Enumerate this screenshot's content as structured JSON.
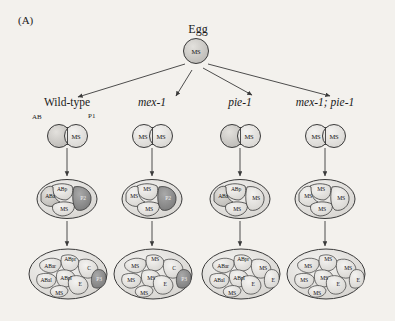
{
  "figure": {
    "panel_label": "(A)",
    "root": {
      "label": "Egg",
      "cell_text": "MS"
    },
    "background_color": "#f3f1ed",
    "cell_fill_light": "#e8e6e2",
    "cell_fill_mid": "#cfcdc9",
    "cell_fill_dark": "#8d8d8d",
    "stroke_color": "#3a3a3a"
  },
  "columns": [
    {
      "name": "wild-type",
      "header": "Wild-type",
      "italic": false
    },
    {
      "name": "mex-1",
      "header": "mex-1",
      "italic": true
    },
    {
      "name": "pie-1",
      "header": "pie-1",
      "italic": true
    },
    {
      "name": "mex-1-pie-1",
      "header": "mex-1; pie-1",
      "italic": true
    }
  ],
  "annotations": {
    "ab_label": "AB",
    "p1_label": "P1"
  },
  "stages": {
    "two_cell": [
      {
        "column": "wild-type",
        "cells": [
          {
            "id": "left",
            "label": "",
            "shade": "mid"
          },
          {
            "id": "right",
            "label": "MS",
            "shade": "light"
          }
        ]
      },
      {
        "column": "mex-1",
        "cells": [
          {
            "id": "left",
            "label": "MS",
            "shade": "light"
          },
          {
            "id": "right",
            "label": "MS",
            "shade": "light"
          }
        ]
      },
      {
        "column": "pie-1",
        "cells": [
          {
            "id": "left",
            "label": "",
            "shade": "mid"
          },
          {
            "id": "right",
            "label": "MS",
            "shade": "light"
          }
        ]
      },
      {
        "column": "mex-1-pie-1",
        "cells": [
          {
            "id": "left",
            "label": "MS",
            "shade": "light"
          },
          {
            "id": "right",
            "label": "MS",
            "shade": "light"
          }
        ]
      }
    ],
    "four_cell": [
      {
        "column": "wild-type",
        "cells": [
          {
            "id": "ABa",
            "label": "ABa",
            "shade": "light"
          },
          {
            "id": "ABp",
            "label": "ABp",
            "shade": "light"
          },
          {
            "id": "MS",
            "label": "MS",
            "shade": "light"
          },
          {
            "id": "P2",
            "label": "P2",
            "shade": "dark"
          }
        ]
      },
      {
        "column": "mex-1",
        "cells": [
          {
            "id": "ABa",
            "label": "MS",
            "shade": "light"
          },
          {
            "id": "ABp",
            "label": "MS",
            "shade": "light"
          },
          {
            "id": "MS",
            "label": "MS",
            "shade": "light"
          },
          {
            "id": "P2",
            "label": "P2",
            "shade": "dark"
          }
        ]
      },
      {
        "column": "pie-1",
        "cells": [
          {
            "id": "ABa",
            "label": "ABa",
            "shade": "light"
          },
          {
            "id": "ABp",
            "label": "ABp",
            "shade": "light"
          },
          {
            "id": "MS",
            "label": "MS",
            "shade": "light"
          },
          {
            "id": "P2",
            "label": "MS",
            "shade": "light"
          }
        ]
      },
      {
        "column": "mex-1-pie-1",
        "cells": [
          {
            "id": "ABa",
            "label": "MS",
            "shade": "light"
          },
          {
            "id": "ABp",
            "label": "MS",
            "shade": "light"
          },
          {
            "id": "MS",
            "label": "MS",
            "shade": "light"
          },
          {
            "id": "P2",
            "label": "MS",
            "shade": "light"
          }
        ]
      }
    ],
    "eight_cell": [
      {
        "column": "wild-type",
        "cells": [
          {
            "id": "ABar",
            "label": "ABar",
            "shade": "light"
          },
          {
            "id": "ABpr",
            "label": "ABpr",
            "shade": "light"
          },
          {
            "id": "ABal",
            "label": "ABal",
            "shade": "light"
          },
          {
            "id": "ABpl",
            "label": "ABpl",
            "shade": "light"
          },
          {
            "id": "MS",
            "label": "MS",
            "shade": "light"
          },
          {
            "id": "E",
            "label": "E",
            "shade": "light"
          },
          {
            "id": "C",
            "label": "C",
            "shade": "light"
          },
          {
            "id": "P3",
            "label": "P3",
            "shade": "dark"
          }
        ]
      },
      {
        "column": "mex-1",
        "cells": [
          {
            "id": "ABar",
            "label": "MS",
            "shade": "light"
          },
          {
            "id": "ABpr",
            "label": "MS",
            "shade": "light"
          },
          {
            "id": "ABal",
            "label": "MS",
            "shade": "light"
          },
          {
            "id": "ABpl",
            "label": "MS",
            "shade": "light"
          },
          {
            "id": "MS",
            "label": "MS",
            "shade": "light"
          },
          {
            "id": "E",
            "label": "E",
            "shade": "light"
          },
          {
            "id": "C",
            "label": "C",
            "shade": "light"
          },
          {
            "id": "P3",
            "label": "P3",
            "shade": "dark"
          }
        ]
      },
      {
        "column": "pie-1",
        "cells": [
          {
            "id": "ABar",
            "label": "ABar",
            "shade": "light"
          },
          {
            "id": "ABpr",
            "label": "ABpr",
            "shade": "light"
          },
          {
            "id": "ABal",
            "label": "ABal",
            "shade": "light"
          },
          {
            "id": "ABpl",
            "label": "ABpl",
            "shade": "light"
          },
          {
            "id": "MS",
            "label": "MS",
            "shade": "light"
          },
          {
            "id": "E",
            "label": "E",
            "shade": "light"
          },
          {
            "id": "C",
            "label": "MS",
            "shade": "light"
          },
          {
            "id": "P3",
            "label": "E",
            "shade": "light"
          }
        ]
      },
      {
        "column": "mex-1-pie-1",
        "cells": [
          {
            "id": "ABar",
            "label": "MS",
            "shade": "light"
          },
          {
            "id": "ABpr",
            "label": "MS",
            "shade": "light"
          },
          {
            "id": "ABal",
            "label": "MS",
            "shade": "light"
          },
          {
            "id": "ABpl",
            "label": "MS",
            "shade": "light"
          },
          {
            "id": "MS",
            "label": "MS",
            "shade": "light"
          },
          {
            "id": "E",
            "label": "E",
            "shade": "light"
          },
          {
            "id": "C",
            "label": "MS",
            "shade": "light"
          },
          {
            "id": "P3",
            "label": "E",
            "shade": "light"
          }
        ]
      }
    ]
  }
}
